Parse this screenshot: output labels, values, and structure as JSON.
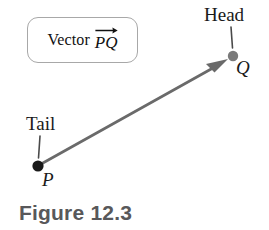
{
  "figure": {
    "caption": "Figure 12.3",
    "caption_color": "#58585a",
    "background_color": "#ffffff",
    "width": 269,
    "height": 230
  },
  "callout": {
    "word": "Vector",
    "vector_name": "PQ",
    "overline_arrow": "right-arrow-overline",
    "border_color": "#a8a8a8"
  },
  "annotations": {
    "head_label": "Head",
    "tail_label": "Tail"
  },
  "points": {
    "tail": {
      "label": "P",
      "x": 38,
      "y": 166,
      "radius": 5.6,
      "color": "#1a1a1a"
    },
    "head": {
      "label": "Q",
      "x": 233,
      "y": 56,
      "radius": 5.2,
      "color": "#7a7a7a"
    }
  },
  "vector_arrow": {
    "from_x": 42,
    "from_y": 163,
    "to_x": 227,
    "to_y": 60,
    "color": "#6a6a6a",
    "width": 2.6
  },
  "leader_lines": {
    "head": {
      "x1": 231,
      "y1": 27,
      "x2": 232,
      "y2": 48,
      "color": "#4a4a4a"
    },
    "tail": {
      "x1": 40,
      "y1": 136,
      "x2": 38,
      "y2": 158,
      "color": "#4a4a4a"
    }
  }
}
